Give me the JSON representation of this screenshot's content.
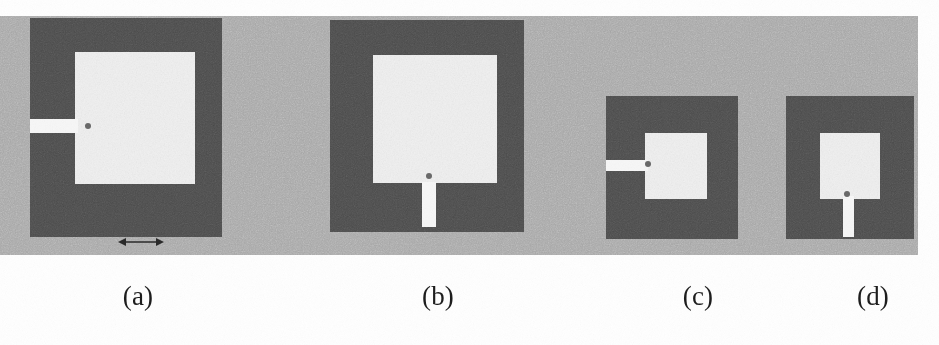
{
  "figure": {
    "kind": "scanned-figure",
    "panel": {
      "background_color": "#a8a8a8",
      "x": 0,
      "y": 16,
      "width": 918,
      "height": 239
    },
    "colors": {
      "page": "#ffffff",
      "panel_gray": "#a8a8a8",
      "ground_dark": "#4c4c4c",
      "patch_light": "#f2f2f2",
      "feed_light": "#f7f7f7",
      "feed_dot": "#6a6a6a",
      "caption_text": "#1d1d1d",
      "arrow": "#2a2a2a"
    },
    "items": [
      {
        "id": "antenna-a",
        "caption": "(a)",
        "feed_type": "side-feed-left",
        "ground": {
          "x": 30,
          "y": 18,
          "width": 192,
          "height": 219
        },
        "patch": {
          "x": 75,
          "y": 52,
          "width": 120,
          "height": 132
        },
        "feed": {
          "x": 30,
          "y": 119,
          "width": 48,
          "height": 14
        },
        "feed_dot": {
          "x": 85,
          "y": 123,
          "width": 6,
          "height": 6
        },
        "dimension_arrow": {
          "x": 118,
          "y": 238,
          "width": 44,
          "height": 9,
          "label": ""
        },
        "caption_x": 88,
        "caption_y": 281,
        "caption_w": 100
      },
      {
        "id": "antenna-b",
        "caption": "(b)",
        "feed_type": "bottom-feed-center",
        "ground": {
          "x": 330,
          "y": 20,
          "width": 194,
          "height": 212
        },
        "patch": {
          "x": 373,
          "y": 55,
          "width": 124,
          "height": 128
        },
        "feed": {
          "x": 422,
          "y": 182,
          "width": 14,
          "height": 43
        },
        "feed_dot": {
          "x": 426,
          "y": 177,
          "width": 6,
          "height": 6
        },
        "dimension_arrow": null,
        "caption_x": 388,
        "caption_y": 281,
        "caption_w": 100
      },
      {
        "id": "antenna-c",
        "caption": "(c)",
        "feed_type": "side-feed-left",
        "ground": {
          "x": 606,
          "y": 96,
          "width": 132,
          "height": 143
        },
        "patch": {
          "x": 645,
          "y": 133,
          "width": 62,
          "height": 66
        },
        "feed": {
          "x": 606,
          "y": 160,
          "width": 42,
          "height": 11
        },
        "feed_dot": {
          "x": 645,
          "y": 161,
          "width": 6,
          "height": 6
        },
        "dimension_arrow": null,
        "caption_x": 648,
        "caption_y": 281,
        "caption_w": 100
      },
      {
        "id": "antenna-d",
        "caption": "(d)",
        "feed_type": "bottom-feed-center",
        "ground": {
          "x": 786,
          "y": 96,
          "width": 128,
          "height": 143
        },
        "patch": {
          "x": 820,
          "y": 133,
          "width": 60,
          "height": 66
        },
        "feed": {
          "x": 843,
          "y": 196,
          "width": 11,
          "height": 40
        },
        "feed_dot": {
          "x": 845,
          "y": 192,
          "width": 6,
          "height": 6
        },
        "dimension_arrow": null,
        "caption_x": 823,
        "caption_y": 281,
        "caption_w": 100
      }
    ]
  }
}
